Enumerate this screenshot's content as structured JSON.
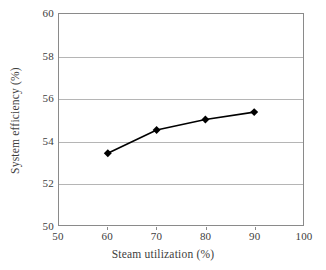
{
  "chart_data": {
    "type": "line",
    "title": "",
    "xlabel": "Steam utilization (%)",
    "ylabel": "System efficiency (%)",
    "x": [
      60,
      70,
      80,
      90
    ],
    "values": [
      53.4,
      54.5,
      55.0,
      55.35
    ],
    "series": [
      {
        "name": "System efficiency",
        "x": [
          60,
          70,
          80,
          90
        ],
        "values": [
          53.4,
          54.5,
          55.0,
          55.35
        ],
        "marker": "diamond",
        "color": "#000000"
      }
    ],
    "xlim": [
      50,
      100
    ],
    "ylim": [
      50,
      60
    ],
    "xticks": [
      50,
      60,
      70,
      80,
      90,
      100
    ],
    "yticks": [
      50,
      52,
      54,
      56,
      58,
      60
    ],
    "xtick_labels": [
      "50",
      "60",
      "70",
      "80",
      "90",
      "100"
    ],
    "ytick_labels": [
      "50",
      "52",
      "54",
      "56",
      "58",
      "60"
    ],
    "grid": {
      "horizontal": true,
      "vertical": false,
      "color": "#b5b5b5"
    },
    "legend": null,
    "legend_position": "none",
    "annotations": [],
    "frame_color": "#8a8a8a",
    "background": "#ffffff"
  }
}
